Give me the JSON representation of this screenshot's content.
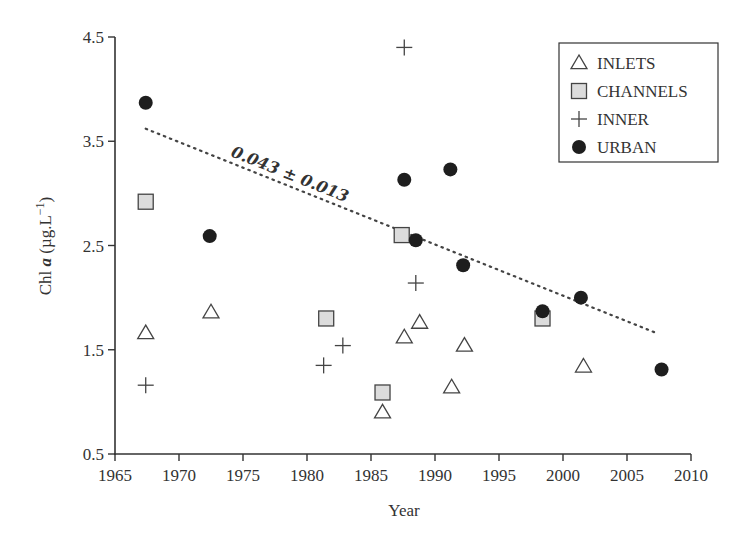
{
  "chart_data": {
    "type": "scatter",
    "title": "",
    "xlabel": "Year",
    "ylabel": "Chl a (µg.L⁻¹)",
    "ylabel_parts": {
      "prefix": "Chl ",
      "italic": "a",
      "suffix": " (µg.L",
      "sup": "−1",
      "close": ")"
    },
    "xlim": [
      1965,
      2010
    ],
    "ylim": [
      0.5,
      4.5
    ],
    "xticks": [
      1965,
      1970,
      1975,
      1980,
      1985,
      1990,
      1995,
      2000,
      2005,
      2010
    ],
    "yticks": [
      0.5,
      1.5,
      2.5,
      3.5,
      4.5
    ],
    "ytick_labels": [
      "0.5",
      "1.5",
      "2.5",
      "3.5",
      "4.5"
    ],
    "grid": false,
    "legend_position": "upper right",
    "series": [
      {
        "name": "INLETS",
        "marker": "triangle-open",
        "points": [
          [
            1967.4,
            1.66
          ],
          [
            1972.5,
            1.86
          ],
          [
            1985.9,
            0.9
          ],
          [
            1987.6,
            1.62
          ],
          [
            1988.8,
            1.76
          ],
          [
            1991.3,
            1.14
          ],
          [
            1992.3,
            1.54
          ],
          [
            2001.6,
            1.34
          ]
        ]
      },
      {
        "name": "CHANNELS",
        "marker": "square-gray",
        "points": [
          [
            1967.4,
            2.92
          ],
          [
            1981.5,
            1.8
          ],
          [
            1985.9,
            1.09
          ],
          [
            1987.4,
            2.6
          ],
          [
            1998.4,
            1.8
          ]
        ]
      },
      {
        "name": "INNER",
        "marker": "plus",
        "points": [
          [
            1967.4,
            1.16
          ],
          [
            1981.3,
            1.35
          ],
          [
            1982.8,
            1.54
          ],
          [
            1987.6,
            4.4
          ],
          [
            1988.5,
            2.14
          ]
        ]
      },
      {
        "name": "URBAN",
        "marker": "circle-filled",
        "points": [
          [
            1967.4,
            3.87
          ],
          [
            1972.4,
            2.59
          ],
          [
            1987.6,
            3.13
          ],
          [
            1988.5,
            2.55
          ],
          [
            1991.2,
            3.23
          ],
          [
            1992.2,
            2.31
          ],
          [
            1998.4,
            1.87
          ],
          [
            2001.4,
            2.0
          ],
          [
            2007.7,
            1.31
          ]
        ]
      }
    ],
    "trendline": {
      "style": "dotted",
      "from": [
        1967.4,
        3.62
      ],
      "to": [
        2007.3,
        1.66
      ],
      "annotation": "0.043 ± 0.013"
    }
  },
  "colors": {
    "axis": "#333333",
    "marker_stroke": "#444444",
    "square_fill": "#dcdcdc",
    "circle_fill": "#1e1e1e",
    "trend": "#444444"
  }
}
